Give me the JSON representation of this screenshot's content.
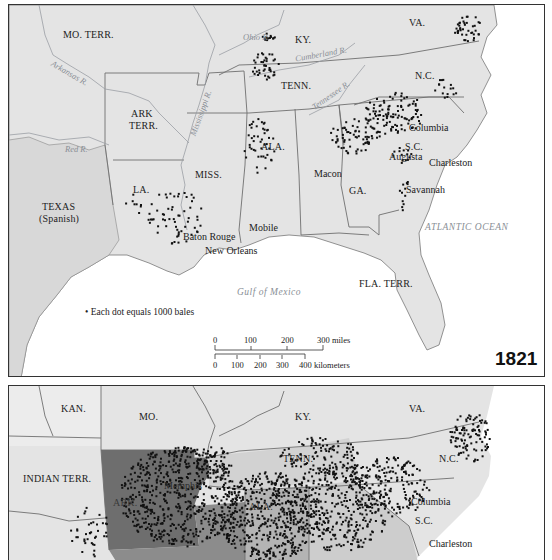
{
  "map_1821": {
    "year": "1821",
    "states": {
      "mo_terr": "MO. TERR.",
      "ky": "KY.",
      "va": "VA.",
      "tenn": "TENN.",
      "nc": "N.C.",
      "ark_terr_1": "ARK",
      "ark_terr_2": "TERR.",
      "miss": "MISS.",
      "ala": "ALA.",
      "la": "LA.",
      "sc": "S.C.",
      "ga": "GA.",
      "texas_1": "TEXAS",
      "texas_2": "(Spanish)",
      "fla_terr": "FLA. TERR."
    },
    "rivers": {
      "ohio": "Ohio R.",
      "cumberland": "Cumberland R.",
      "arkansas": "Arkansas R.",
      "mississippi": "Mississippi R.",
      "tennessee": "Tennessee R.",
      "red": "Red R."
    },
    "cities": {
      "columbia": "Columbia",
      "augusta": "Augusta",
      "charleston": "Charleston",
      "macon": "Macon",
      "savannah": "Savannah",
      "mobile": "Mobile",
      "baton_rouge": "Baton Rouge",
      "new_orleans": "New Orleans"
    },
    "water": {
      "atlantic": "ATLANTIC OCEAN",
      "gulf": "Gulf of Mexico"
    },
    "legend": {
      "bullet": "•",
      "text": "Each dot equals 1000 bales"
    },
    "scale": {
      "miles": [
        "0",
        "100",
        "200",
        "300 miles"
      ],
      "km": [
        "0",
        "100",
        "200",
        "300",
        "400 kilometers"
      ]
    }
  },
  "map_1859": {
    "states": {
      "kan": "KAN.",
      "mo": "MO.",
      "ky": "KY.",
      "va": "VA.",
      "indian_terr": "INDIAN TERR.",
      "tenn": "TENN.",
      "nc": "N.C.",
      "ark": "ARK.",
      "ala": "ALA.",
      "sc": "S.C."
    },
    "cities": {
      "memphis": "Memphis",
      "columbia": "Columbia",
      "charleston": "Charleston"
    }
  },
  "colors": {
    "land": "#e4e4e4",
    "water": "#ffffff",
    "border": "#6f6f6f",
    "river": "#9a9ea4",
    "dot": "#111111",
    "ark_1859": "#6e6e6e",
    "deep_south_1859": "#8c8c8c",
    "tenn_1859": "#c8c8c8"
  }
}
